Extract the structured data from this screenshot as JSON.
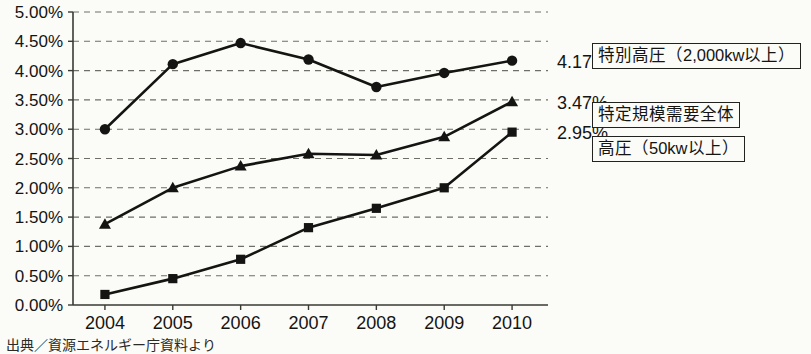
{
  "chart_data": {
    "type": "line",
    "title": "",
    "xlabel": "",
    "ylabel": "",
    "categories": [
      "2004",
      "2005",
      "2006",
      "2007",
      "2008",
      "2009",
      "2010"
    ],
    "ylim": [
      0,
      5
    ],
    "ytick_labels": [
      "0.00%",
      "0.50%",
      "1.00%",
      "1.50%",
      "2.00%",
      "2.50%",
      "3.00%",
      "3.50%",
      "4.00%",
      "4.50%",
      "5.00%"
    ],
    "ytick_values": [
      0,
      0.5,
      1,
      1.5,
      2,
      2.5,
      3,
      3.5,
      4,
      4.5,
      5
    ],
    "grid": true,
    "grid_style": "dashed-horizontal",
    "legend_position": "right-inline",
    "series": [
      {
        "name": "特別高圧（2,000kw以上）",
        "marker": "circle",
        "values": [
          3.0,
          4.11,
          4.47,
          4.19,
          3.72,
          3.96,
          4.17
        ],
        "end_label": "4.17%"
      },
      {
        "name": "特定規模需要全体",
        "marker": "triangle",
        "values": [
          1.38,
          2.0,
          2.37,
          2.58,
          2.56,
          2.87,
          3.47
        ],
        "end_label": "3.47%"
      },
      {
        "name": "高圧（50kw以上）",
        "marker": "square",
        "values": [
          0.18,
          0.45,
          0.78,
          1.32,
          1.65,
          2.0,
          2.95
        ],
        "end_label": "2.95%"
      }
    ]
  },
  "legend": {
    "tokubetsu_kouatsu": "特別高圧（2,000kw以上）",
    "zentai": "特定規模需要全体",
    "kouatsu": "高圧（50kw以上）"
  },
  "end_labels": {
    "series1": "4.17%",
    "series2": "3.47%",
    "series3": "2.95%"
  },
  "source_note": "出典／資源エネルギー庁資料より",
  "colors": {
    "ink": "#141412",
    "paper": "#fbfbf8",
    "grid": "#6f6f68",
    "axis": "#3a3a35"
  }
}
